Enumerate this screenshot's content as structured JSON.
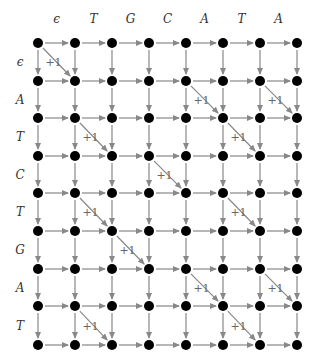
{
  "diagram": {
    "type": "edit-graph",
    "column_labels": [
      "ϵ",
      "T",
      "G",
      "C",
      "A",
      "T",
      "A"
    ],
    "row_labels": [
      "ϵ",
      "A",
      "T",
      "C",
      "T",
      "G",
      "A",
      "T"
    ],
    "node_x": [
      38,
      75,
      112,
      149,
      186,
      223,
      260,
      297
    ],
    "node_y": [
      43,
      81,
      118,
      156,
      193,
      231,
      269,
      306,
      345
    ],
    "col_label_y": 23,
    "row_label_x": 20,
    "diagonal_weight_label": "+1",
    "diagonals": [
      {
        "row": 0,
        "col": 0
      },
      {
        "row": 1,
        "col": 4
      },
      {
        "row": 1,
        "col": 6
      },
      {
        "row": 2,
        "col": 1
      },
      {
        "row": 2,
        "col": 5
      },
      {
        "row": 3,
        "col": 3
      },
      {
        "row": 4,
        "col": 1
      },
      {
        "row": 4,
        "col": 5
      },
      {
        "row": 5,
        "col": 2
      },
      {
        "row": 6,
        "col": 4
      },
      {
        "row": 6,
        "col": 6
      },
      {
        "row": 7,
        "col": 1
      },
      {
        "row": 7,
        "col": 5
      }
    ],
    "colors": {
      "node": "#000000",
      "edge": "#888888",
      "label": "#333333"
    }
  }
}
